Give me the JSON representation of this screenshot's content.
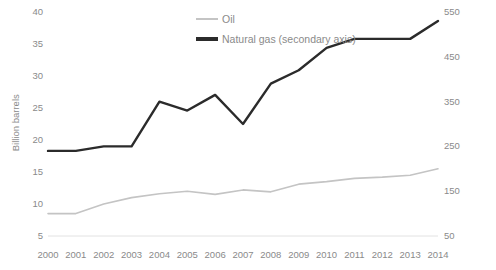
{
  "chart_data": {
    "type": "line",
    "title": "",
    "xlabel": "",
    "categories": [
      "2000",
      "2001",
      "2002",
      "2003",
      "2004",
      "2005",
      "2006",
      "2007",
      "2008",
      "2009",
      "2010",
      "2011",
      "2012",
      "2013",
      "2014"
    ],
    "grid": false,
    "legend_position": "top-center",
    "series": [
      {
        "name": "Oil",
        "axis": "primary",
        "color": "#c4c4c4",
        "unit": "Billion barrels",
        "values": [
          8.5,
          8.5,
          10.0,
          11.0,
          11.6,
          12.0,
          11.5,
          12.2,
          11.9,
          13.1,
          13.5,
          14.0,
          14.2,
          14.5,
          15.5
        ]
      },
      {
        "name": "Natural gas (secondary axis)",
        "axis": "secondary",
        "color": "#2b2b2b",
        "unit": "Billion m³",
        "values": [
          240,
          240,
          250,
          250,
          350,
          330,
          365,
          300,
          390,
          420,
          470,
          490,
          490,
          490,
          530
        ]
      }
    ],
    "y_left": {
      "label": "Billion barrels",
      "ticks": [
        5,
        10,
        15,
        20,
        25,
        30,
        35,
        40
      ],
      "ylim": [
        5,
        40
      ]
    },
    "y_right": {
      "label": "Billion m³",
      "ticks": [
        50,
        150,
        250,
        350,
        450,
        550
      ],
      "ylim": [
        50,
        550
      ]
    }
  },
  "legend": {
    "items": [
      {
        "label": "Oil",
        "swatch": "oil-line-swatch"
      },
      {
        "label": "Natural gas (secondary axis)",
        "swatch": "gas-line-swatch"
      }
    ]
  }
}
